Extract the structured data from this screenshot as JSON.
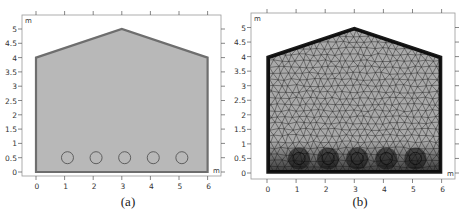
{
  "figure": {
    "panels": [
      {
        "id": "a",
        "caption": "(a)",
        "description": "Geometry",
        "x_ticks": [
          "0",
          "1",
          "2",
          "3",
          "4",
          "5",
          "6"
        ],
        "y_ticks": [
          "0",
          "0.5",
          "1",
          "1.5",
          "2",
          "2.5",
          "3",
          "3.5",
          "4",
          "4.5",
          "5"
        ],
        "x_unit": "m",
        "y_unit": "m",
        "fill_color": "#b8b8b8",
        "border_color": "#6e6e6e"
      },
      {
        "id": "b",
        "caption": "(b)",
        "description": "Mesh",
        "x_ticks": [
          "0",
          "1",
          "2",
          "3",
          "4",
          "5",
          "6"
        ],
        "y_ticks": [
          "0",
          "0.5",
          "1",
          "1.5",
          "2",
          "2.5",
          "3",
          "3.5",
          "4",
          "4.5",
          "5"
        ],
        "x_unit": "m",
        "y_unit": "m",
        "fill_color": "#9a9a9a",
        "border_color": "#1a1a1a"
      }
    ],
    "geometry": {
      "outline_vertices_m": [
        [
          0,
          0
        ],
        [
          6,
          0
        ],
        [
          6,
          4
        ],
        [
          3,
          5
        ],
        [
          0,
          4
        ]
      ],
      "circles_m": [
        {
          "x": 1.1,
          "y": 0.5,
          "r": 0.2
        },
        {
          "x": 2.1,
          "y": 0.5,
          "r": 0.2
        },
        {
          "x": 3.1,
          "y": 0.5,
          "r": 0.2
        },
        {
          "x": 4.1,
          "y": 0.5,
          "r": 0.2
        },
        {
          "x": 5.1,
          "y": 0.5,
          "r": 0.2
        }
      ]
    }
  }
}
